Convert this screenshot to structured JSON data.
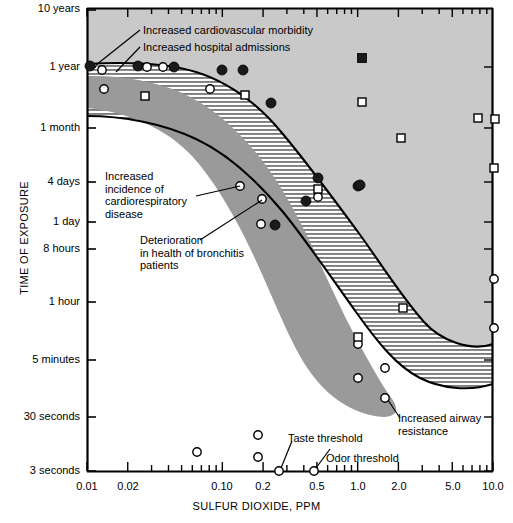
{
  "chart_data": {
    "type": "scatter",
    "title": "",
    "xlabel": "SULFUR DIOXIDE, PPM",
    "ylabel": "TIME OF EXPOSURE",
    "xscale": "log",
    "yscale": "log-time",
    "xlim": [
      0.01,
      10.0
    ],
    "grid": false,
    "legend": "none",
    "x_ticks": [
      {
        "label": "0.01",
        "value": 0.01
      },
      {
        "label": "0.02",
        "value": 0.02
      },
      {
        "label": "0.10",
        "value": 0.1
      },
      {
        "label": "0.2",
        "value": 0.2
      },
      {
        "label": "0.5",
        "value": 0.5
      },
      {
        "label": "1.0",
        "value": 1.0
      },
      {
        "label": "2.0",
        "value": 2.0
      },
      {
        "label": "5.0",
        "value": 5.0
      },
      {
        "label": "10.0",
        "value": 10.0
      }
    ],
    "y_ticks": [
      {
        "label": "10 years",
        "y": 10
      },
      {
        "label": "1 year",
        "y": 67
      },
      {
        "label": "1 month",
        "y": 128
      },
      {
        "label": "4 days",
        "y": 182
      },
      {
        "label": "1 day",
        "y": 222
      },
      {
        "label": "8 hours",
        "y": 249
      },
      {
        "label": "1 hour",
        "y": 302
      },
      {
        "label": "5 minutes",
        "y": 360
      },
      {
        "label": "30 seconds",
        "y": 417
      },
      {
        "label": "3 seconds",
        "y": 471
      }
    ],
    "annotations": [
      {
        "text": "Increased cardiovascular morbidity",
        "id": "increased-cardiovascular-morbidity"
      },
      {
        "text": "Increased hospital admissions",
        "id": "increased-hospital-admissions"
      },
      {
        "text": "Increased\nincidence of\ncardiorespiratory\ndisease",
        "id": "increased-incidence-of-cardiorespiratory-disease"
      },
      {
        "text": "Deterioration\nin health of bronchitis\npatients",
        "id": "deterioration-in-health-of-bronchitis-patients"
      },
      {
        "text": "Increased airway\nresistance",
        "id": "increased-airway-resistance"
      },
      {
        "text": "Taste threshold",
        "id": "taste-threshold"
      },
      {
        "text": "Odor threshold",
        "id": "odor-threshold"
      }
    ],
    "regions": [
      {
        "name": "upper-effects-region",
        "fill": "#c9c9c9",
        "desc": "light gray region above upper curve"
      },
      {
        "name": "cardiorespiratory-band",
        "fill": "#ffffff",
        "pattern": "horizontal-hatch",
        "desc": "hatched band between the two curves"
      },
      {
        "name": "bronchitis-region",
        "fill": "#9a9a9a",
        "desc": "dark gray region below lower curve"
      }
    ],
    "series": [
      {
        "name": "filled-circles",
        "marker": "filled-circle",
        "color": "#1a1a1a",
        "points": [
          [
            90,
            66
          ],
          [
            138,
            66
          ],
          [
            174,
            67
          ],
          [
            222,
            70
          ],
          [
            243,
            70
          ],
          [
            271,
            103
          ],
          [
            318,
            178
          ],
          [
            358,
            186
          ],
          [
            306,
            201
          ],
          [
            275,
            225
          ],
          [
            360,
            185
          ]
        ]
      },
      {
        "name": "open-circles",
        "marker": "open-circle",
        "color": "#ffffff",
        "points": [
          [
            102,
            70
          ],
          [
            147,
            67
          ],
          [
            163,
            67
          ],
          [
            104,
            89
          ],
          [
            210,
            89
          ],
          [
            240,
            186
          ],
          [
            262,
            199
          ],
          [
            318,
            197
          ],
          [
            261,
            224
          ],
          [
            358,
            344
          ],
          [
            385,
            368
          ],
          [
            358,
            378
          ],
          [
            385,
            398
          ],
          [
            494,
            328
          ],
          [
            197,
            452
          ],
          [
            258,
            435
          ],
          [
            258,
            457
          ],
          [
            279,
            471
          ],
          [
            314,
            471
          ],
          [
            494,
            279
          ]
        ]
      },
      {
        "name": "open-squares",
        "marker": "open-square",
        "color": "#ffffff",
        "points": [
          [
            145,
            96
          ],
          [
            245,
            95
          ],
          [
            362,
            102
          ],
          [
            401,
            138
          ],
          [
            478,
            118
          ],
          [
            495,
            119
          ],
          [
            494,
            168
          ],
          [
            403,
            308
          ],
          [
            358,
            337
          ],
          [
            318,
            189
          ]
        ]
      },
      {
        "name": "filled-squares",
        "marker": "filled-square",
        "color": "#1a1a1a",
        "points": [
          [
            362,
            58
          ]
        ]
      }
    ]
  },
  "colors": {
    "upper_region": "#c9c9c9",
    "lower_region": "#9a9a9a",
    "hatch_band": "#ffffff",
    "axis": "#000000",
    "marker_fill": "#1a1a1a",
    "marker_open": "#ffffff"
  },
  "axis_titles": {
    "x": "SULFUR DIOXIDE, PPM",
    "y": "TIME OF EXPOSURE"
  }
}
